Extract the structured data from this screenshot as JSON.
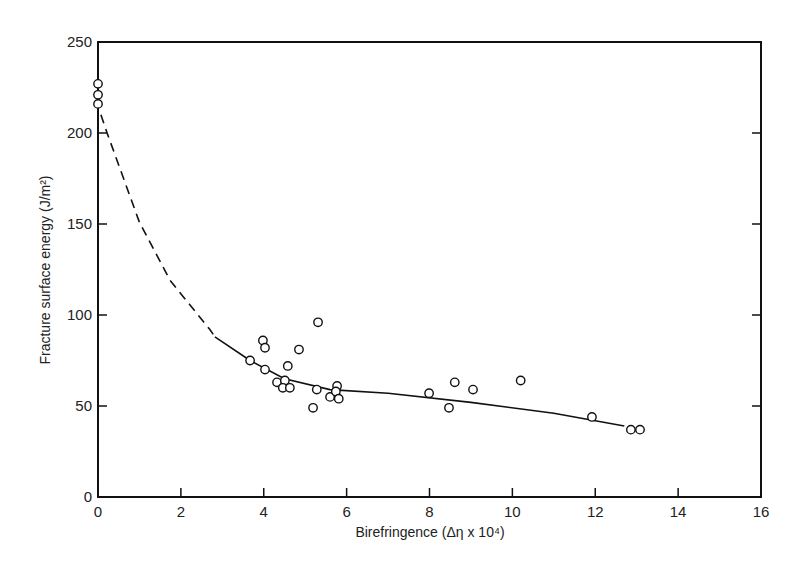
{
  "chart_data": {
    "type": "scatter",
    "title": "",
    "xlabel": "Birefringence (Δη x 10⁴)",
    "ylabel": "Fracture surface energy (J/m²)",
    "xlim": [
      0,
      16
    ],
    "ylim": [
      0,
      250
    ],
    "xticks": [
      0,
      2,
      4,
      6,
      8,
      10,
      12,
      14,
      16
    ],
    "yticks": [
      0,
      50,
      100,
      150,
      200,
      250
    ],
    "grid": false,
    "legend": null,
    "series": [
      {
        "name": "measurements",
        "marker": "open-circle",
        "points": [
          [
            0.0,
            227
          ],
          [
            0.0,
            221
          ],
          [
            0.0,
            216
          ],
          [
            3.67,
            75
          ],
          [
            3.98,
            86
          ],
          [
            4.03,
            82
          ],
          [
            4.03,
            70
          ],
          [
            4.32,
            63
          ],
          [
            4.51,
            64
          ],
          [
            4.46,
            60
          ],
          [
            4.63,
            60
          ],
          [
            4.58,
            72
          ],
          [
            4.85,
            81
          ],
          [
            5.31,
            96
          ],
          [
            5.19,
            49
          ],
          [
            5.28,
            59
          ],
          [
            5.6,
            55
          ],
          [
            5.77,
            61
          ],
          [
            5.74,
            58
          ],
          [
            5.81,
            54
          ],
          [
            7.99,
            57
          ],
          [
            8.47,
            49
          ],
          [
            8.61,
            63
          ],
          [
            9.05,
            59
          ],
          [
            10.2,
            64
          ],
          [
            11.92,
            44
          ],
          [
            12.86,
            37
          ],
          [
            13.08,
            37
          ]
        ]
      },
      {
        "name": "fit-extrapolated",
        "style": "dashed",
        "points": [
          [
            0.07,
            210
          ],
          [
            0.22,
            200
          ],
          [
            1.0,
            151
          ],
          [
            1.74,
            119
          ],
          [
            2.7,
            92
          ],
          [
            2.82,
            88
          ]
        ]
      },
      {
        "name": "fit",
        "style": "solid",
        "points": [
          [
            2.82,
            88
          ],
          [
            3.67,
            75
          ],
          [
            4.5,
            65
          ],
          [
            5.6,
            59
          ],
          [
            7.0,
            57
          ],
          [
            9.0,
            52
          ],
          [
            11.0,
            46
          ],
          [
            12.7,
            39
          ]
        ]
      }
    ]
  }
}
